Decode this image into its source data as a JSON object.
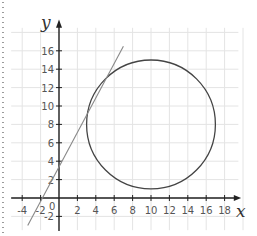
{
  "chart_data": {
    "type": "line",
    "title": "",
    "xlabel": "x",
    "ylabel": "y",
    "xlim": [
      -5,
      20
    ],
    "ylim": [
      -3,
      18
    ],
    "grid": true,
    "x_ticks": [
      -4,
      -2,
      2,
      4,
      6,
      8,
      10,
      12,
      14,
      16,
      18
    ],
    "y_ticks": [
      -2,
      2,
      4,
      6,
      8,
      10,
      12,
      14,
      16
    ],
    "origin_label": "0",
    "series": [
      {
        "name": "circle",
        "shape": "circle",
        "center": [
          10,
          8
        ],
        "radius": 7,
        "color": "#444444"
      },
      {
        "name": "tangent line",
        "shape": "line",
        "points": [
          [
            -3.4,
            -3
          ],
          [
            7,
            16.5
          ]
        ],
        "tangent_point": [
          3.6,
          10.8
        ],
        "color": "#888888"
      }
    ]
  },
  "colors": {
    "grid": "#e4e4e4",
    "axis": "#222222",
    "circle": "#444444",
    "line": "#8a8a8a"
  }
}
